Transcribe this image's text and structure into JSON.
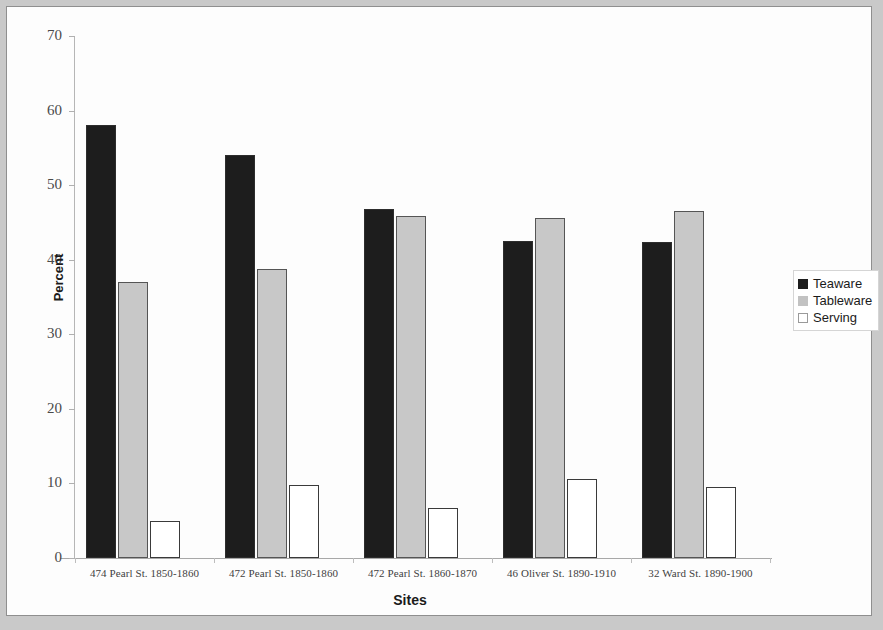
{
  "chart_data": {
    "type": "bar",
    "title": "",
    "xlabel": "Sites",
    "ylabel": "Percent",
    "ylim": [
      0,
      70
    ],
    "ytick_step": 10,
    "yticks": [
      70,
      60,
      50,
      40,
      30,
      20,
      10,
      0
    ],
    "grid": false,
    "legend_position": "right",
    "categories": [
      "474 Pearl St. 1850-1860",
      "472 Pearl St. 1850-1860",
      "472 Pearl St. 1860-1870",
      "46 Oliver St. 1890-1910",
      "32 Ward St. 1890-1900"
    ],
    "series": [
      {
        "name": "Teaware",
        "color": "#1d1d1d",
        "values": [
          58.0,
          54.0,
          46.8,
          42.5,
          42.4
        ]
      },
      {
        "name": "Tableware",
        "color": "#c8c8c8",
        "values": [
          37.0,
          38.8,
          45.8,
          45.6,
          46.5
        ]
      },
      {
        "name": "Serving",
        "color": "#ffffff",
        "values": [
          5.0,
          9.8,
          6.7,
          10.6,
          9.5
        ]
      }
    ]
  },
  "axes": {
    "y_title": "Percent",
    "x_title": "Sites"
  },
  "legend": {
    "items": [
      {
        "label": "Teaware",
        "swatch": "swatch-black"
      },
      {
        "label": "Tableware",
        "swatch": "swatch-gray"
      },
      {
        "label": "Serving",
        "swatch": "swatch-white"
      }
    ]
  }
}
